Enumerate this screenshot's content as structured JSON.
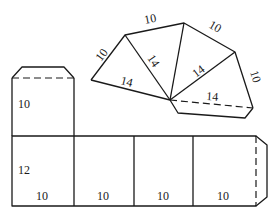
{
  "figure": {
    "colors": {
      "line": "#1a1a1a",
      "background": "#ffffff"
    }
  },
  "fan": {
    "labels": {
      "left_edge": "10",
      "top_edge_1": "10",
      "top_edge_2": "10",
      "right_edge": "10",
      "diag_1": "14",
      "diag_2": "14",
      "diag_3": "14",
      "diag_4": "14"
    }
  },
  "top_box": {
    "height_label": "10"
  },
  "strip": {
    "height_label": "12",
    "width_labels": [
      "10",
      "10",
      "10",
      "10"
    ]
  }
}
